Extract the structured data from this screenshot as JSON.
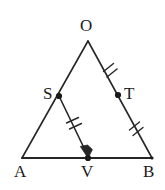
{
  "figure": {
    "kind": "euclidean-geometry-diagram",
    "background_color": "#ffffff",
    "stroke_color": "#262626",
    "label_color": "#1a1a1a",
    "points": [
      {
        "id": "O",
        "label": "O",
        "x": 88,
        "y": 41,
        "has_dot": false
      },
      {
        "id": "S",
        "label": "S",
        "x": 59,
        "y": 96,
        "has_dot": true
      },
      {
        "id": "T",
        "label": "T",
        "x": 118,
        "y": 95,
        "has_dot": true
      },
      {
        "id": "A",
        "label": "A",
        "x": 22,
        "y": 158,
        "has_dot": false
      },
      {
        "id": "V",
        "label": "V",
        "x": 88,
        "y": 158,
        "has_dot": true
      },
      {
        "id": "B",
        "label": "B",
        "x": 152,
        "y": 158,
        "has_dot": true
      }
    ],
    "segments": [
      {
        "id": "OA",
        "from": "O",
        "to": "A",
        "ticks": 0,
        "arrow": false
      },
      {
        "id": "OB",
        "from": "O",
        "to": "B",
        "ticks": 0,
        "arrow": false
      },
      {
        "id": "AB",
        "from": "A",
        "to": "B",
        "ticks": 0,
        "arrow": false
      },
      {
        "id": "SV",
        "from": "S",
        "to": "V",
        "ticks": 2,
        "arrow": true
      }
    ],
    "tick_marks": [
      {
        "id": "ticks-OT",
        "on_segment": "OT",
        "count": 2,
        "x": 110,
        "y": 68
      },
      {
        "id": "ticks-TB",
        "on_segment": "TB",
        "count": 2,
        "x": 136,
        "y": 127
      },
      {
        "id": "ticks-SV",
        "on_segment": "SV",
        "count": 2,
        "x": 74,
        "y": 124
      }
    ]
  },
  "labels": {
    "O": "O",
    "S": "S",
    "T": "T",
    "A": "A",
    "V": "V",
    "B": "B"
  }
}
